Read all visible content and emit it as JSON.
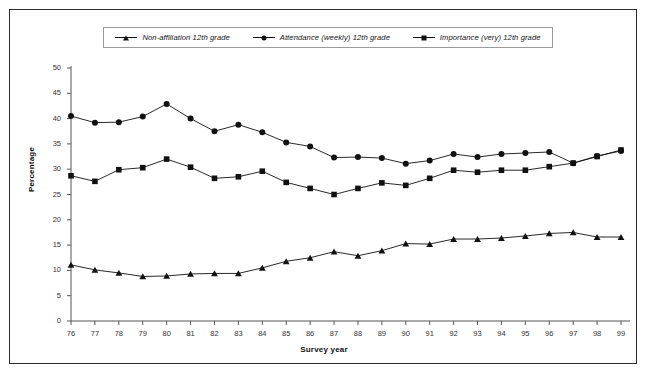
{
  "chart_data": {
    "type": "line",
    "title": "",
    "xlabel": "Survey year",
    "ylabel": "Percentage",
    "ylim": [
      0,
      50
    ],
    "yticks": [
      0,
      5,
      10,
      15,
      20,
      25,
      30,
      35,
      40,
      45,
      50
    ],
    "grid": false,
    "legend_position": "top-center",
    "categories": [
      "76",
      "77",
      "78",
      "79",
      "80",
      "81",
      "82",
      "83",
      "84",
      "85",
      "86",
      "87",
      "88",
      "89",
      "90",
      "91",
      "92",
      "93",
      "94",
      "95",
      "96",
      "97",
      "98",
      "99"
    ],
    "series": [
      {
        "name": "Non-affiliation 12th grade",
        "marker": "triangle",
        "color": "#111111",
        "values": [
          11.1,
          10.1,
          9.5,
          8.8,
          8.9,
          9.3,
          9.4,
          9.4,
          10.5,
          11.8,
          12.5,
          13.7,
          12.9,
          13.9,
          15.3,
          15.2,
          16.2,
          16.2,
          16.4,
          16.8,
          17.3,
          17.5,
          16.6,
          16.6
        ]
      },
      {
        "name": "Attendance (weekly) 12th grade",
        "marker": "circle",
        "color": "#111111",
        "values": [
          40.5,
          39.2,
          39.3,
          40.4,
          42.9,
          40.0,
          37.5,
          38.8,
          37.3,
          35.3,
          34.5,
          32.3,
          32.4,
          32.2,
          31.1,
          31.7,
          33.0,
          32.4,
          33.0,
          33.2,
          33.4,
          31.2,
          32.6,
          33.6
        ]
      },
      {
        "name": "Importance (very) 12th grade",
        "marker": "square",
        "color": "#111111",
        "values": [
          28.7,
          27.6,
          29.9,
          30.3,
          32.0,
          30.4,
          28.2,
          28.5,
          29.6,
          27.4,
          26.2,
          25.0,
          26.2,
          27.3,
          26.8,
          28.2,
          29.8,
          29.4,
          29.8,
          29.8,
          30.5,
          31.2,
          32.5,
          33.8
        ]
      }
    ]
  },
  "legend": {
    "items": [
      {
        "label": "Non-affiliation 12th grade",
        "marker": "triangle"
      },
      {
        "label": "Attendance (weekly) 12th grade",
        "marker": "circle"
      },
      {
        "label": "Importance (very) 12th grade",
        "marker": "square"
      }
    ]
  }
}
